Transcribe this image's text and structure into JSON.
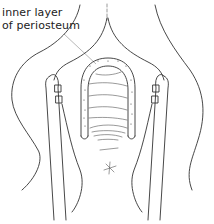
{
  "figure": {
    "annotation": {
      "line1": "inner layer",
      "line2": "of periosteum"
    },
    "colors": {
      "line": "#333333",
      "leader": "#888888",
      "background": "#ffffff"
    }
  }
}
